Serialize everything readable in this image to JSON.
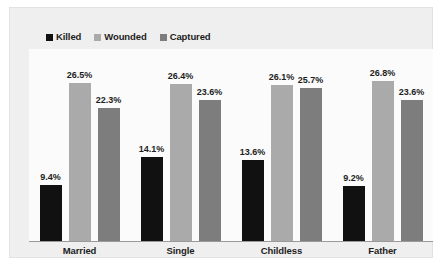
{
  "chart_data": {
    "type": "bar",
    "title": "",
    "subtitle": "",
    "xlabel": "",
    "ylabel": "",
    "grid": false,
    "legend_position": "top-left",
    "ylim": [
      0,
      30
    ],
    "value_suffix": "%",
    "categories": [
      "Married",
      "Single",
      "Childless",
      "Father"
    ],
    "series": [
      {
        "name": "Killed",
        "color": "#111111",
        "values": [
          9.4,
          14.1,
          13.6,
          9.2
        ],
        "labels": [
          "9.4%",
          "14.1%",
          "13.6%",
          "9.2%"
        ]
      },
      {
        "name": "Wounded",
        "color": "#aaaaaa",
        "values": [
          26.5,
          26.4,
          26.1,
          26.8
        ],
        "labels": [
          "26.5%",
          "26.4%",
          "26.1%",
          "26.8%"
        ]
      },
      {
        "name": "Captured",
        "color": "#7d7d7d",
        "values": [
          22.3,
          23.6,
          25.7,
          23.6
        ],
        "labels": [
          "22.3%",
          "23.6%",
          "25.7%",
          "23.6%"
        ]
      }
    ]
  },
  "legend": {
    "items": [
      {
        "label": "Killed",
        "color": "#111111"
      },
      {
        "label": "Wounded",
        "color": "#aaaaaa"
      },
      {
        "label": "Captured",
        "color": "#7d7d7d"
      }
    ]
  },
  "colors": {
    "figure_background": "#efefef",
    "plot_background": "#fbfbfb",
    "axis_line": "#9a9a9a",
    "text": "#1d1d1d",
    "killed": "#111111",
    "wounded": "#aaaaaa",
    "captured": "#7d7d7d"
  }
}
